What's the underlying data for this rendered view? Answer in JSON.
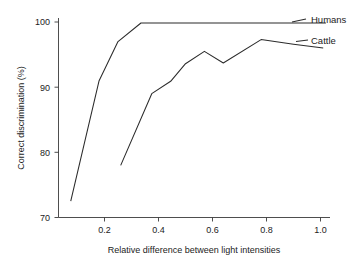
{
  "chart_data": {
    "type": "line",
    "title": "",
    "xlabel": "Relative difference between light intensities",
    "ylabel": "Correct discrimination (%)",
    "xlim": [
      0.0,
      1.06
    ],
    "ylim": [
      70,
      100.8
    ],
    "xticks": [
      0.2,
      0.4,
      0.6,
      0.8,
      1.0
    ],
    "xtick_labels": [
      "0.2",
      "0.4",
      "0.6",
      "0.8",
      "1.0"
    ],
    "yticks": [
      70,
      80,
      90,
      100
    ],
    "ytick_labels": [
      "70",
      "80",
      "90",
      "100"
    ],
    "grid": false,
    "legend_position": "right-inline-labels",
    "series": [
      {
        "name": "Humans",
        "label": "Humans",
        "color": "#2b2b2b",
        "x": [
          0.075,
          0.18,
          0.25,
          0.335,
          0.55,
          0.75,
          0.92,
          1.02
        ],
        "y": [
          72.5,
          91.0,
          97.0,
          99.85,
          99.85,
          99.85,
          99.85,
          99.85
        ]
      },
      {
        "name": "Cattle",
        "label": "Cattle",
        "color": "#2b2b2b",
        "x": [
          0.26,
          0.375,
          0.445,
          0.5,
          0.57,
          0.64,
          0.78,
          0.9,
          1.01
        ],
        "y": [
          78.0,
          89.0,
          90.9,
          93.6,
          95.5,
          93.7,
          97.3,
          96.6,
          96.0
        ]
      }
    ]
  },
  "labels": {
    "xaxis_title": "Relative difference between light intensities",
    "yaxis_title": "Correct discrimination (%)",
    "series_humans": "Humans",
    "series_cattle": "Cattle",
    "ytick_100": "100",
    "ytick_90": "90",
    "ytick_80": "80",
    "ytick_70": "70",
    "xtick_02": "0.2",
    "xtick_04": "0.4",
    "xtick_06": "0.6",
    "xtick_08": "0.8",
    "xtick_10": "1.0"
  }
}
